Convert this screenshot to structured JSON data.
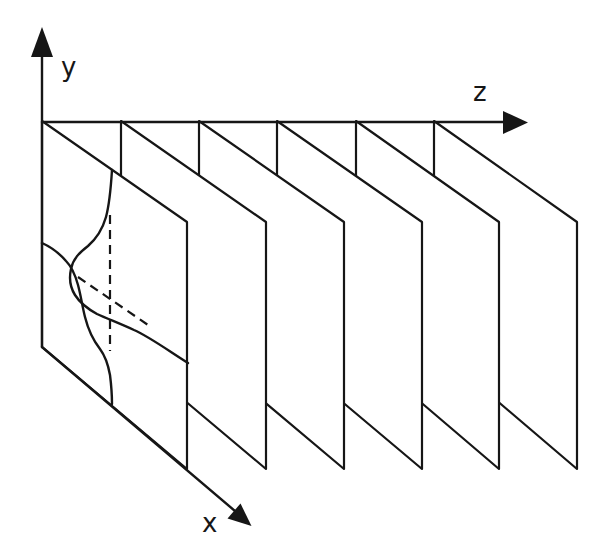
{
  "figure": {
    "background_color": "#ffffff",
    "line_color": "#161616",
    "axis_labels": {
      "y": "y",
      "z": "z",
      "x": "x"
    },
    "axes": {
      "y_line": "M 42 32 L 42 347",
      "y_arrow": "M 42 27 L 31 57 L 53 57 Z",
      "z_line": "M 42 122 L 505 122",
      "z_arrow": "M 528 122.5 L 503 111 L 503 134 Z",
      "x_line": "M 42 347 L 235 511",
      "x_arrow": "M 251.5 526 L 227.5 518.5 L 240.5 503.5 Z"
    },
    "planes": {
      "count": 6,
      "polygons": [
        {
          "id": "plane-6",
          "points": "434,121 577,222 577,469 434,347"
        },
        {
          "id": "plane-5",
          "points": "356,121 499,222 499,469 356,347"
        },
        {
          "id": "plane-4",
          "points": "277,121 422,222 422,469 277,347"
        },
        {
          "id": "plane-3",
          "points": "199,121 344,222 344,469 199,347"
        },
        {
          "id": "plane-2",
          "points": "121,121 266,222 266,469 121,347"
        },
        {
          "id": "plane-1",
          "points": "42,121 187,222 187,469 42,347"
        }
      ]
    },
    "profile": {
      "curve_a": "M 112 170 C 111 186 110 202 106 217 C 102 231 96 239 88 246 C 79 253 73 259 71 269 C 69 278 70 287 75 295 C 80 303 88 309 97 314 C 108 319 121 324 134 330 C 148 336 166 349 188 363",
      "curve_b": "M 42 243 C 51 247 60 254 66 261 C 72 267 75 274 78 285 C 81 296 82 305 85 317 C 88 329 93 340 100 349 C 106 357 108 364 110 375 C 111 383 112 392 112 404",
      "dashed_vertical": "M 110 215 L 110 351",
      "dashed_diagonal": "M 78 277 L 151 327"
    }
  }
}
